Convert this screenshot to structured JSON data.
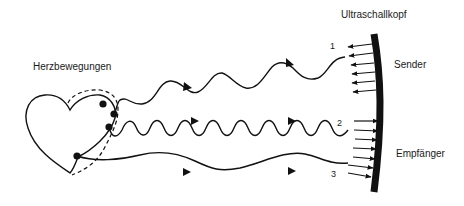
{
  "diagram": {
    "labels": {
      "heart_motion": "Herzbewegungen",
      "transducer": "Ultraschallkopf",
      "sender": "Sender",
      "receiver": "Empfänger"
    },
    "paths": [
      {
        "id": "1",
        "label": "1",
        "direction": "transducer-to-heart",
        "type": "emitted wave"
      },
      {
        "id": "2",
        "label": "2",
        "direction": "heart-to-transducer",
        "type": "reflected wave (high frequency)"
      },
      {
        "id": "3",
        "label": "3",
        "direction": "heart-to-transducer",
        "type": "reflected wave (low frequency)"
      }
    ],
    "colors": {
      "ink": "#111111",
      "background": "#ffffff"
    }
  }
}
